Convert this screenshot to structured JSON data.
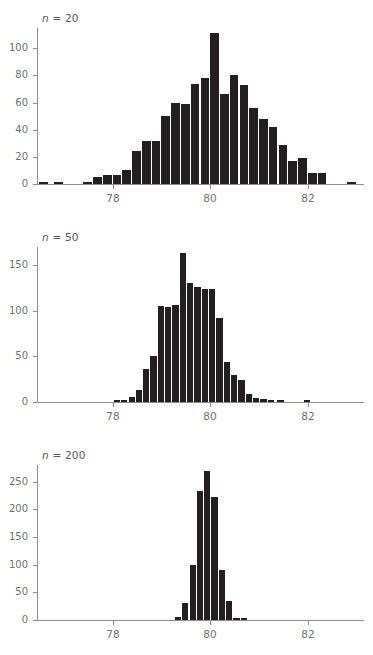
{
  "figure": {
    "title": "",
    "panels": [
      {
        "id": "panel-n20",
        "label": "n = 20",
        "label_italic_prefix": "n",
        "label_rest": " = 20"
      },
      {
        "id": "panel-n50",
        "label": "n = 50",
        "label_italic_prefix": "n",
        "label_rest": " = 50"
      },
      {
        "id": "panel-n200",
        "label": "n = 200",
        "label_italic_prefix": "n",
        "label_rest": " = 200"
      }
    ]
  },
  "colors": {
    "bar": "#231f20",
    "axis": "#8d8d8f",
    "text": "#58585a",
    "tick_text": "#6f6f71",
    "background": "#ffffff"
  },
  "chart_data": [
    {
      "type": "bar",
      "title": "n = 20",
      "xlabel": "",
      "ylabel": "",
      "grid": false,
      "legend": "none",
      "xlim": [
        76.45,
        83.15
      ],
      "ylim": [
        0,
        115
      ],
      "xticks": [
        78,
        80,
        82
      ],
      "xticklabels": [
        "78",
        "80",
        "82"
      ],
      "yticks": [
        0,
        20,
        40,
        60,
        80,
        100
      ],
      "yticklabels": [
        "0",
        "20",
        "40",
        "60",
        "80",
        "100"
      ],
      "bin_width": 0.2,
      "bin_centers": [
        76.6,
        76.9,
        77.5,
        77.7,
        77.9,
        78.1,
        78.3,
        78.5,
        78.7,
        78.9,
        79.1,
        79.3,
        79.5,
        79.7,
        79.9,
        80.1,
        80.3,
        80.5,
        80.7,
        80.9,
        81.1,
        81.3,
        81.5,
        81.7,
        81.9,
        82.1,
        82.3,
        82.9
      ],
      "values": [
        1,
        1,
        1,
        5,
        7,
        7,
        10,
        24,
        32,
        32,
        50,
        60,
        59,
        74,
        78,
        111,
        66,
        80,
        73,
        56,
        48,
        42,
        29,
        17,
        19,
        8,
        8,
        1
      ]
    },
    {
      "type": "bar",
      "title": "n = 50",
      "xlabel": "",
      "ylabel": "",
      "grid": false,
      "legend": "none",
      "xlim": [
        76.45,
        83.15
      ],
      "ylim": [
        0,
        170
      ],
      "xticks": [
        78,
        80,
        82
      ],
      "xticklabels": [
        "78",
        "80",
        "82"
      ],
      "yticks": [
        0,
        50,
        100,
        150
      ],
      "yticklabels": [
        "0",
        "50",
        "100",
        "150"
      ],
      "bin_width": 0.15,
      "bin_centers": [
        78.1,
        78.25,
        78.4,
        78.55,
        78.7,
        78.85,
        79.0,
        79.15,
        79.3,
        79.45,
        79.6,
        79.75,
        79.9,
        80.05,
        80.2,
        80.35,
        80.5,
        80.65,
        80.8,
        80.95,
        81.1,
        81.25,
        81.45,
        82.0
      ],
      "values": [
        1,
        1,
        5,
        13,
        36,
        51,
        105,
        104,
        106,
        163,
        131,
        126,
        124,
        124,
        92,
        44,
        30,
        24,
        9,
        4,
        3,
        1,
        1,
        1
      ]
    },
    {
      "type": "bar",
      "title": "n = 200",
      "xlabel": "",
      "ylabel": "",
      "grid": false,
      "legend": "none",
      "xlim": [
        76.45,
        83.15
      ],
      "ylim": [
        0,
        280
      ],
      "xticks": [
        78,
        80,
        82
      ],
      "xticklabels": [
        "78",
        "80",
        "82"
      ],
      "yticks": [
        0,
        50,
        100,
        150,
        200,
        250
      ],
      "yticklabels": [
        "0",
        "50",
        "100",
        "150",
        "200",
        "250"
      ],
      "bin_width": 0.15,
      "bin_centers": [
        79.35,
        79.5,
        79.65,
        79.8,
        79.95,
        80.1,
        80.25,
        80.4,
        80.55,
        80.7
      ],
      "values": [
        6,
        31,
        100,
        233,
        270,
        222,
        90,
        35,
        3,
        2
      ]
    }
  ]
}
